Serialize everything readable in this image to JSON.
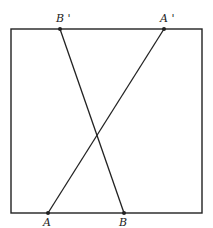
{
  "diagram": {
    "colors": {
      "stroke": "#222222",
      "background": "#ffffff"
    },
    "frame": {
      "x1": 11,
      "y1": 29,
      "x2": 202,
      "y2": 213
    },
    "points": [
      {
        "id": "A",
        "label": "A",
        "x": 48,
        "y": 213
      },
      {
        "id": "B",
        "label": "B",
        "x": 124,
        "y": 213
      },
      {
        "id": "A_prime",
        "label": "A'",
        "x": 164,
        "y": 29
      },
      {
        "id": "B_prime",
        "label": "B'",
        "x": 60,
        "y": 29
      }
    ],
    "segments": [
      {
        "from": "A",
        "to": "A_prime"
      },
      {
        "from": "B",
        "to": "B_prime"
      }
    ],
    "labels": {
      "A": "A",
      "B": "B",
      "A_prime": "A '",
      "B_prime": "B '"
    }
  }
}
